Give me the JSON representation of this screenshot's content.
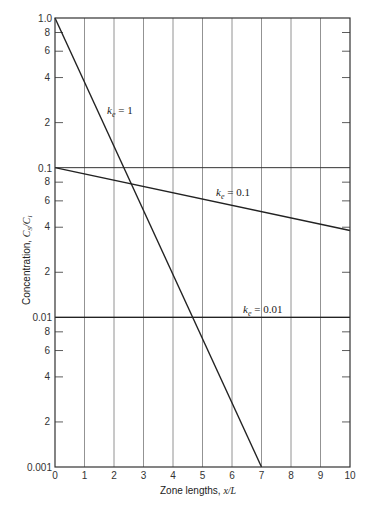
{
  "chart_data": {
    "type": "line",
    "title": "",
    "xlabel": "Zone lengths, x/L",
    "ylabel": "Concentration, C_S/C_l",
    "xlim": [
      0,
      10
    ],
    "ylim": [
      0.001,
      1.0
    ],
    "yscale": "log",
    "grid": "vertical lines at each integer x; horizontal lines at decades",
    "x_ticks": [
      "0",
      "1",
      "2",
      "3",
      "4",
      "5",
      "6",
      "7",
      "8",
      "9",
      "10"
    ],
    "y_ticks": [
      "0.001",
      "2",
      "4",
      "6",
      "8",
      "0.01",
      "2",
      "4",
      "6",
      "8",
      "0.1",
      "2",
      "4",
      "6",
      "8",
      "1.0"
    ],
    "series": [
      {
        "name": "k_e = 1",
        "x": [
          0,
          7
        ],
        "values": [
          1.0,
          0.001
        ]
      },
      {
        "name": "k_e = 0.1",
        "x": [
          0,
          10
        ],
        "values": [
          0.1,
          0.038
        ]
      },
      {
        "name": "k_e = 0.01",
        "x": [
          0,
          10
        ],
        "values": [
          0.01,
          0.01
        ]
      }
    ],
    "annotations": [
      "k_e = 1",
      "k_e = 0.1",
      "k_e = 0.01"
    ]
  },
  "labels": {
    "xlabel": "Zone lengths, x/L",
    "ylabel": "Concentration, C_S/C_l",
    "ann1": "k_e = 1",
    "ann2": "k_e = 0.1",
    "ann3": "k_e = 0.01"
  }
}
